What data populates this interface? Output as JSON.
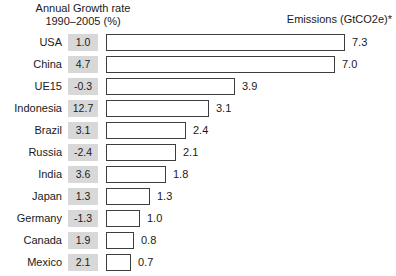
{
  "header": {
    "growth_line1": "Annual Growth rate",
    "growth_line2": "1990–2005 (%)",
    "emissions": "Emissions (GtCO2e)*"
  },
  "chart_data": {
    "type": "bar",
    "orientation": "horizontal",
    "title": "",
    "categories": [
      "USA",
      "China",
      "UE15",
      "Indonesia",
      "Brazil",
      "Russia",
      "India",
      "Japan",
      "Germany",
      "Canada",
      "Mexico"
    ],
    "series": [
      {
        "name": "Annual Growth rate 1990–2005 (%)",
        "display": "gray-value-box",
        "values": [
          1.0,
          4.7,
          -0.3,
          12.7,
          3.1,
          -2.4,
          3.6,
          1.3,
          -1.3,
          1.9,
          2.1
        ]
      },
      {
        "name": "Emissions (GtCO2e)*",
        "display": "horizontal-bar",
        "values": [
          7.3,
          7.0,
          3.9,
          3.1,
          2.4,
          2.1,
          1.8,
          1.3,
          1.0,
          0.8,
          0.7
        ]
      }
    ],
    "xlim": [
      0,
      7.5
    ],
    "grid": false,
    "legend": "none",
    "colors": {
      "bar_fill": "#ffffff",
      "bar_border": "#3d3d3d",
      "growth_box_bg": "#d8d8d8",
      "text": "#1a1a1a"
    }
  }
}
